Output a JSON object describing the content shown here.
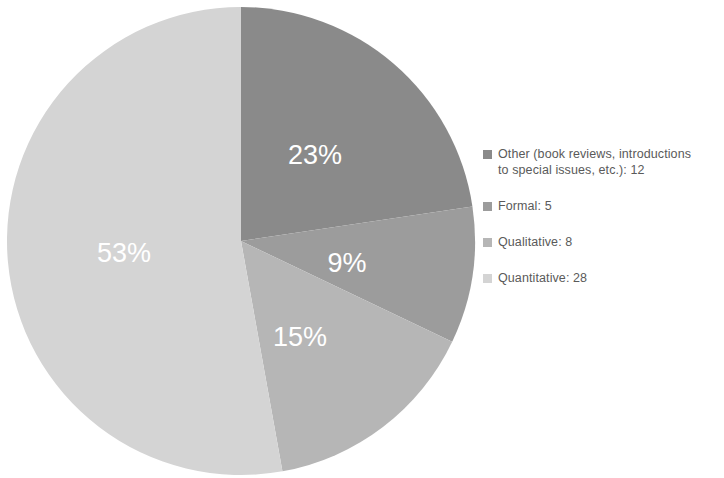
{
  "chart_data": {
    "type": "pie",
    "title": "",
    "subtitle": "",
    "xlabel": "",
    "ylabel": "",
    "grid": false,
    "legend_position": "right",
    "start_angle_deg": 0,
    "direction": "clockwise",
    "categories": [
      "Other (book reviews, introductions to special issues, etc.)",
      "Formal",
      "Qualitative",
      "Quantitative"
    ],
    "values": [
      12,
      5,
      8,
      28
    ],
    "total": 53,
    "percentages": [
      23,
      9,
      15,
      53
    ],
    "data_labels": [
      "23%",
      "9%",
      "15%",
      "53%"
    ],
    "colors": [
      "#8a8a8a",
      "#9c9c9c",
      "#b6b6b6",
      "#d4d4d4"
    ],
    "slices": [
      {
        "name": "Other (book reviews, introductions to special issues, etc.)",
        "value": 12,
        "percent": 23,
        "label": "23%",
        "color": "#8a8a8a",
        "start_deg": 0,
        "end_deg": 81.5,
        "label_x": 315,
        "label_y": 157
      },
      {
        "name": "Formal",
        "value": 5,
        "percent": 9,
        "label": "9%",
        "color": "#9c9c9c",
        "start_deg": 81.5,
        "end_deg": 115.5,
        "label_x": 347,
        "label_y": 265
      },
      {
        "name": "Qualitative",
        "value": 8,
        "percent": 15,
        "label": "15%",
        "color": "#b6b6b6",
        "start_deg": 115.5,
        "end_deg": 169.8,
        "label_x": 300,
        "label_y": 339
      },
      {
        "name": "Quantitative",
        "value": 28,
        "percent": 53,
        "label": "53%",
        "color": "#d4d4d4",
        "start_deg": 169.8,
        "end_deg": 360,
        "label_x": 124,
        "label_y": 255
      }
    ]
  },
  "legend": {
    "items": [
      {
        "label": "Other (book reviews, introductions\nto special issues, etc.): 12",
        "swatch_color": "#8a8a8a"
      },
      {
        "label": "Formal: 5",
        "swatch_color": "#9c9c9c"
      },
      {
        "label": "Qualitative: 8",
        "swatch_color": "#b6b6b6"
      },
      {
        "label": "Quantitative: 28",
        "swatch_color": "#d4d4d4"
      }
    ]
  },
  "geometry": {
    "center_x": 241,
    "center_y": 241,
    "radius": 234
  }
}
